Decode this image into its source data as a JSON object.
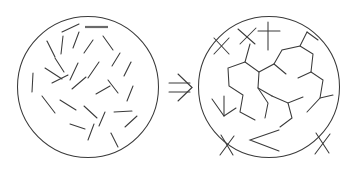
{
  "figure": {
    "background_color": "#ffffff",
    "ink_color": "#3a3a3a",
    "accent_color": "#6a6a6a",
    "width": 354,
    "height": 175
  },
  "arrow": {
    "symbol": "double-right-arrow",
    "glyph": "⇒",
    "x": 178,
    "y": 88
  },
  "panels": [
    {
      "name": "left-panel",
      "label": "unconnected-segments",
      "circle": {
        "cx": 88,
        "cy": 87,
        "r": 70.5
      },
      "segment_count": 27,
      "segments": [
        [
          62,
          32,
          79,
          24
        ],
        [
          47,
          41,
          55,
          57
        ],
        [
          63,
          36,
          61,
          54
        ],
        [
          79,
          32,
          73,
          48
        ],
        [
          55,
          58,
          64,
          72
        ],
        [
          33,
          73,
          32,
          92
        ],
        [
          45,
          68,
          62,
          79
        ],
        [
          52,
          83,
          68,
          75
        ],
        [
          42,
          96,
          55,
          113
        ],
        [
          60,
          100,
          76,
          110
        ],
        [
          72,
          89,
          86,
          77
        ],
        [
          78,
          63,
          70,
          80
        ],
        [
          84,
          53,
          93,
          40
        ],
        [
          103,
          36,
          113,
          50
        ],
        [
          99,
          62,
          88,
          78
        ],
        [
          112,
          66,
          120,
          53
        ],
        [
          108,
          80,
          118,
          93
        ],
        [
          124,
          76,
          131,
          62
        ],
        [
          133,
          86,
          127,
          101
        ],
        [
          96,
          94,
          110,
          86
        ],
        [
          84,
          106,
          97,
          118
        ],
        [
          70,
          124,
          85,
          129
        ],
        [
          99,
          126,
          105,
          112
        ],
        [
          114,
          112,
          132,
          111
        ],
        [
          88,
          140,
          94,
          124
        ],
        [
          111,
          133,
          118,
          147
        ],
        [
          125,
          127,
          137,
          116
        ]
      ],
      "thick_segments": [
        [
          85,
          27,
          108,
          27
        ]
      ]
    },
    {
      "name": "right-panel",
      "label": "connected-clusters",
      "circle": {
        "cx": 269,
        "cy": 87,
        "r": 70.5
      },
      "segment_count": 38,
      "polylines": [
        [
          [
            214,
            38
          ],
          [
            229,
            54
          ]
        ],
        [
          [
            229,
            38
          ],
          [
            214,
            54
          ]
        ],
        [
          [
            238,
            29
          ],
          [
            255,
            44
          ]
        ],
        [
          [
            256,
            28
          ],
          [
            240,
            44
          ]
        ],
        [
          [
            268,
            22
          ],
          [
            268,
            50
          ]
        ],
        [
          [
            258,
            31
          ],
          [
            280,
            31
          ]
        ],
        [
          [
            250,
            44
          ],
          [
            245,
            62
          ],
          [
            259,
            72
          ],
          [
            258,
            88
          ],
          [
            272,
            96
          ]
        ],
        [
          [
            245,
            62
          ],
          [
            228,
            68
          ],
          [
            229,
            86
          ],
          [
            243,
            95
          ],
          [
            240,
            112
          ],
          [
            255,
            120
          ]
        ],
        [
          [
            259,
            72
          ],
          [
            274,
            64
          ],
          [
            286,
            74
          ]
        ],
        [
          [
            274,
            64
          ],
          [
            282,
            50
          ],
          [
            300,
            46
          ],
          [
            307,
            32
          ]
        ],
        [
          [
            300,
            46
          ],
          [
            313,
            54
          ],
          [
            311,
            72
          ],
          [
            323,
            80
          ],
          [
            320,
            98
          ],
          [
            307,
            112
          ]
        ],
        [
          [
            258,
            88
          ],
          [
            268,
            103
          ],
          [
            265,
            118
          ]
        ],
        [
          [
            272,
            96
          ],
          [
            288,
            103
          ],
          [
            303,
            97
          ]
        ],
        [
          [
            288,
            103
          ],
          [
            292,
            118
          ],
          [
            280,
            127
          ]
        ],
        [
          [
            307,
            32
          ],
          [
            318,
            40
          ]
        ],
        [
          [
            311,
            72
          ],
          [
            298,
            78
          ]
        ],
        [
          [
            212,
            99
          ],
          [
            224,
            116
          ],
          [
            236,
            108
          ]
        ],
        [
          [
            224,
            116
          ],
          [
            224,
            96
          ]
        ],
        [
          [
            221,
            135
          ],
          [
            233,
            155
          ]
        ],
        [
          [
            234,
            136
          ],
          [
            220,
            155
          ]
        ],
        [
          [
            279,
            151
          ],
          [
            250,
            140
          ],
          [
            279,
            130
          ]
        ],
        [
          [
            316,
            133
          ],
          [
            329,
            153
          ]
        ],
        [
          [
            330,
            134
          ],
          [
            315,
            154
          ]
        ],
        [
          [
            320,
            98
          ],
          [
            333,
            95
          ]
        ]
      ]
    }
  ]
}
